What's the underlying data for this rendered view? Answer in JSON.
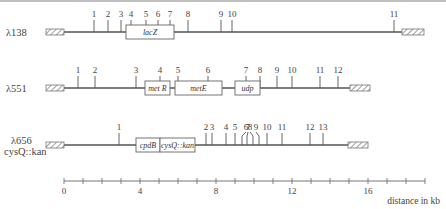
{
  "constructs": [
    {
      "name": "λ138",
      "subname": "",
      "y": 32,
      "hatch_left": [
        46,
        64
      ],
      "hatch_right": [
        402,
        424
      ],
      "line": [
        64,
        402
      ],
      "ticks": [
        {
          "label": "1",
          "x": 94
        },
        {
          "label": "2",
          "x": 108
        },
        {
          "label": "3",
          "x": 121
        },
        {
          "label": "4",
          "x": 131
        },
        {
          "label": "5",
          "x": 146
        },
        {
          "label": "6",
          "x": 158
        },
        {
          "label": "7",
          "x": 170
        },
        {
          "label": "8",
          "x": 188
        },
        {
          "label": "9",
          "x": 221
        },
        {
          "label": "10",
          "x": 232
        },
        {
          "label": "11",
          "x": 394
        }
      ],
      "genes": [
        {
          "label": "lacZ",
          "x1": 126,
          "x2": 174
        }
      ]
    },
    {
      "name": "λ551",
      "subname": "",
      "y": 88,
      "hatch_left": [
        46,
        64
      ],
      "hatch_right": [
        350,
        370
      ],
      "line": [
        64,
        350
      ],
      "ticks": [
        {
          "label": "1",
          "x": 78
        },
        {
          "label": "2",
          "x": 95
        },
        {
          "label": "3",
          "x": 136
        },
        {
          "label": "4",
          "x": 160
        },
        {
          "label": "5",
          "x": 178
        },
        {
          "label": "6",
          "x": 208
        },
        {
          "label": "7",
          "x": 246
        },
        {
          "label": "8",
          "x": 260
        },
        {
          "label": "9",
          "x": 277
        },
        {
          "label": "10",
          "x": 292
        },
        {
          "label": "11",
          "x": 320
        },
        {
          "label": "12",
          "x": 338
        }
      ],
      "genes": [
        {
          "label": "met R",
          "x1": 145,
          "x2": 170
        },
        {
          "label": "metE",
          "x1": 175,
          "x2": 222
        },
        {
          "label": "udp",
          "x1": 235,
          "x2": 260
        }
      ]
    },
    {
      "name": "λ656",
      "subname": "cysQ::kan",
      "y": 145,
      "hatch_left": [
        46,
        64
      ],
      "hatch_right": [
        348,
        368
      ],
      "line": [
        64,
        348
      ],
      "ticks": [
        {
          "label": "1",
          "x": 119
        },
        {
          "label": "2",
          "x": 206
        },
        {
          "label": "3",
          "x": 212
        },
        {
          "label": "4",
          "x": 226
        },
        {
          "label": "5",
          "x": 235
        },
        {
          "label": "6",
          "x": 242,
          "tx": 246
        },
        {
          "label": "7",
          "x": 247,
          "tx": 248
        },
        {
          "label": "8",
          "x": 253,
          "tx": 250
        },
        {
          "label": "9",
          "x": 259,
          "tx": 256
        },
        {
          "label": "10",
          "x": 267
        },
        {
          "label": "11",
          "x": 282
        },
        {
          "label": "12",
          "x": 310
        },
        {
          "label": "13",
          "x": 323
        }
      ],
      "genes": [
        {
          "label": "cpdB",
          "x1": 136,
          "x2": 160
        },
        {
          "label": "cysQ::kan",
          "x1": 160,
          "x2": 195
        }
      ]
    }
  ],
  "axis": {
    "y": 181,
    "x0": 64,
    "x_end": 425,
    "px_per_kb": 19,
    "max_kb": 19,
    "tick_labels": [
      "0",
      "4",
      "8",
      "12",
      "16"
    ],
    "tick_label_values": [
      0,
      4,
      8,
      12,
      16
    ],
    "unit_label": "distance in kb"
  },
  "colors": {
    "line": "#555555",
    "box_stroke": "#666666",
    "hatch": "#777777",
    "text": "#444444"
  }
}
